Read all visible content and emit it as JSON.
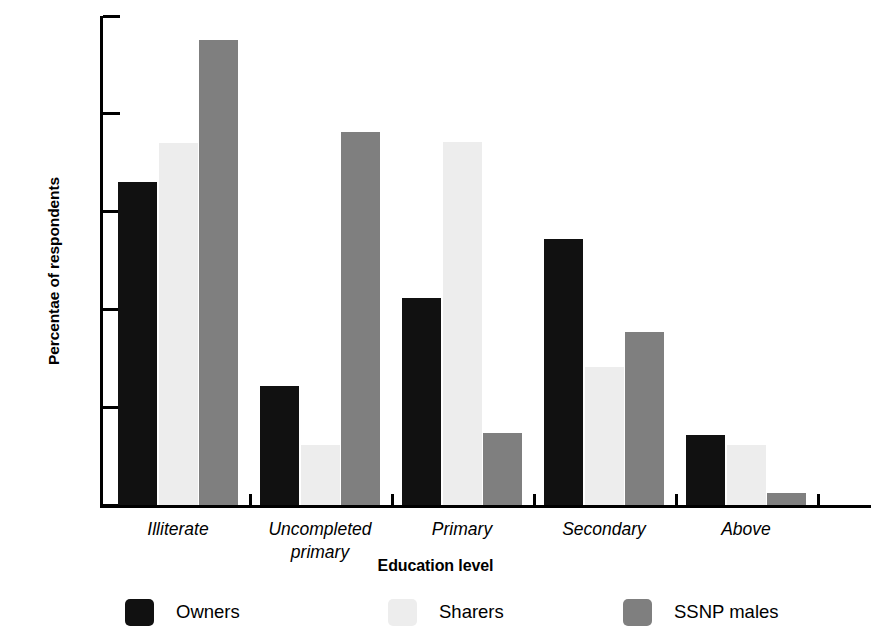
{
  "chart_data": {
    "type": "bar",
    "title": "",
    "xlabel": "Education level",
    "ylabel": "Percentae of respondents",
    "categories": [
      "Illiterate",
      "Uncompleted\nprimary",
      "Primary",
      "Secondary",
      "Above"
    ],
    "series": [
      {
        "name": "Owners",
        "color": "#111111",
        "values": [
          33.0,
          12.2,
          21.2,
          27.2,
          7.2
        ]
      },
      {
        "name": "Sharers",
        "color": "#ededed",
        "values": [
          37.0,
          6.1,
          37.1,
          14.1,
          6.1
        ]
      },
      {
        "name": "SSNP males",
        "color": "#7f7f7f",
        "values": [
          47.5,
          38.1,
          7.4,
          17.7,
          1.2
        ]
      }
    ],
    "ylim": [
      0,
      50
    ],
    "ytick_values": [
      0,
      10,
      20,
      30,
      40,
      50
    ],
    "ytick_labels": [
      "0%",
      "10%",
      "20%",
      "30%",
      "40%",
      "50%"
    ],
    "grid": false,
    "legend_position": "bottom"
  },
  "legend": {
    "items": [
      {
        "label": "Owners",
        "swatch": "owners"
      },
      {
        "label": "Sharers",
        "swatch": "sharers"
      },
      {
        "label": "SSNP males",
        "swatch": "ssnp"
      }
    ]
  }
}
